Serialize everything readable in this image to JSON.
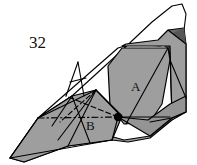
{
  "figure": {
    "step_number": "32",
    "labels": {
      "face_a": "A",
      "face_b": "B"
    },
    "colors": {
      "paper_light": "#ffffff",
      "paper_gray": "#9e9e9e",
      "paper_gray_mid": "#949494",
      "paper_dark": "#6b6b6b",
      "paper_darker": "#565656",
      "line": "#000000",
      "text": "#101010",
      "background": "#ffffff"
    },
    "geometry": {
      "shapes": [
        {
          "name": "white-upper-flap",
          "fill": "#ffffff",
          "stroke": "#000000",
          "stroke_width": 1.1,
          "points": "38,118 72,96 118,54 152,22 172,6 182,4 186,14 184,30 176,42 160,46 132,44 118,48"
        },
        {
          "name": "dark-right-edge-band",
          "fill": "#6b6b6b",
          "stroke": "#000000",
          "stroke_width": 1.0,
          "points": "168,30 184,28 186,44 186,96 184,112 172,118 170,60"
        },
        {
          "name": "dark-upper-right-wedge",
          "fill": "#565656",
          "stroke": "none",
          "stroke_width": 0,
          "points": "158,40 184,28 186,46 170,52"
        },
        {
          "name": "main-gray-body",
          "fill": "#9e9e9e",
          "stroke": "#000000",
          "stroke_width": 1.2,
          "points": "122,46 170,46 172,118 150,136 124,140 96,132 72,122 38,118 10,158 24,162 68,146 112,140 128,142 150,138 172,120 186,112 186,44 168,30 158,40 142,42 126,44"
        },
        {
          "name": "gray-hexagon-face-A",
          "fill": "#9e9e9e",
          "stroke": "#000000",
          "stroke_width": 1.2,
          "points": "122,48 168,48 170,60 162,104 150,122 124,124 110,106 108,66"
        },
        {
          "name": "gray-lower-left-panel",
          "fill": "#9e9e9e",
          "stroke": "#000000",
          "stroke_width": 1.2,
          "points": "38,118 72,96 96,90 122,116 112,140 68,146 24,162 10,158"
        },
        {
          "name": "gray-lower-right-panel",
          "fill": "#949494",
          "stroke": "#000000",
          "stroke_width": 1.2,
          "points": "118,117 150,136 172,118 186,112 186,96 170,104 148,120"
        }
      ],
      "solid_lines": [
        {
          "name": "fold-a-left-diag",
          "x1": 38,
          "y1": 118,
          "x2": 96,
          "y2": 90
        },
        {
          "name": "fold-a-vert-1",
          "x1": 52,
          "y1": 126,
          "x2": 72,
          "y2": 96
        },
        {
          "name": "fold-a-vert-2",
          "x1": 68,
          "y1": 146,
          "x2": 96,
          "y2": 90
        },
        {
          "name": "fold-a-cross-1",
          "x1": 72,
          "y1": 96,
          "x2": 90,
          "y2": 143
        },
        {
          "name": "fold-a-cross-2",
          "x1": 96,
          "y1": 90,
          "x2": 58,
          "y2": 140
        },
        {
          "name": "fold-b-right",
          "x1": 96,
          "y1": 90,
          "x2": 122,
          "y2": 117
        },
        {
          "name": "fold-b-lower",
          "x1": 118,
          "y1": 117,
          "x2": 112,
          "y2": 140
        },
        {
          "name": "fold-horizontal-spine",
          "x1": 118,
          "y1": 117,
          "x2": 170,
          "y2": 117
        },
        {
          "name": "fold-a-hex-inner",
          "x1": 168,
          "y1": 48,
          "x2": 126,
          "y2": 124
        },
        {
          "name": "fold-a-hex-lower-right",
          "x1": 150,
          "y1": 122,
          "x2": 172,
          "y2": 118
        },
        {
          "name": "fold-right-band-diag",
          "x1": 170,
          "y1": 60,
          "x2": 186,
          "y2": 98
        },
        {
          "name": "fold-right-outer",
          "x1": 172,
          "y1": 118,
          "x2": 186,
          "y2": 112
        },
        {
          "name": "tail-bottom-edge",
          "x1": 10,
          "y1": 158,
          "x2": 112,
          "y2": 140
        },
        {
          "name": "tail-left-edge",
          "x1": 10,
          "y1": 158,
          "x2": 38,
          "y2": 118
        },
        {
          "name": "spike-left",
          "x1": 66,
          "y1": 96,
          "x2": 78,
          "y2": 62
        },
        {
          "name": "spike-right",
          "x1": 78,
          "y1": 62,
          "x2": 84,
          "y2": 96
        },
        {
          "name": "spike-bar",
          "x1": 70,
          "y1": 82,
          "x2": 86,
          "y2": 78
        }
      ],
      "dashed_lines": [
        {
          "name": "crease-dashed-upper",
          "x1": 118,
          "y1": 117,
          "x2": 66,
          "y2": 96
        },
        {
          "name": "crease-dashed-lower-left",
          "x1": 96,
          "y1": 90,
          "x2": 60,
          "y2": 122
        }
      ],
      "dashdot_lines": [
        {
          "name": "axis-dash-dot",
          "x1": 38,
          "y1": 118,
          "x2": 118,
          "y2": 117
        }
      ],
      "markers": [
        {
          "name": "pivot-dot",
          "cx": 118,
          "cy": 117,
          "r": 4.2,
          "fill": "#000000"
        }
      ],
      "text_positions": {
        "step_number": {
          "x": 29,
          "y": 48
        },
        "face_a": {
          "x": 131,
          "y": 91
        },
        "face_b": {
          "x": 86,
          "y": 130
        }
      }
    }
  }
}
